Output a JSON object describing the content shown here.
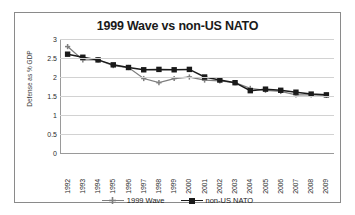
{
  "chart_data": {
    "type": "line",
    "title": "1999 Wave vs non-US NATO",
    "xlabel": "",
    "ylabel": "Defense as % GDP",
    "categories": [
      "1992",
      "1993",
      "1994",
      "1995",
      "1996",
      "1997",
      "1998",
      "1999",
      "2000",
      "2001",
      "2002",
      "2003",
      "2004",
      "2005",
      "2006",
      "2007",
      "2008",
      "2009"
    ],
    "ylim": [
      0,
      3
    ],
    "yticks": [
      "0",
      "0.5",
      "1",
      "1.5",
      "2",
      "2.5",
      "3"
    ],
    "grid": true,
    "legend_position": "bottom",
    "series": [
      {
        "name": "1999 Wave",
        "color": "#7f7f7f",
        "marker": "cross",
        "values": [
          2.8,
          2.45,
          2.45,
          2.3,
          2.25,
          1.96,
          1.85,
          1.96,
          2.0,
          1.92,
          1.9,
          1.85,
          1.7,
          1.65,
          1.62,
          1.53,
          1.53,
          1.52
        ]
      },
      {
        "name": "non-US NATO",
        "color": "#1a1a1a",
        "marker": "square",
        "values": [
          2.6,
          2.52,
          2.45,
          2.32,
          2.25,
          2.19,
          2.2,
          2.19,
          2.2,
          2.0,
          1.92,
          1.85,
          1.64,
          1.68,
          1.65,
          1.6,
          1.55,
          1.53
        ]
      }
    ]
  }
}
